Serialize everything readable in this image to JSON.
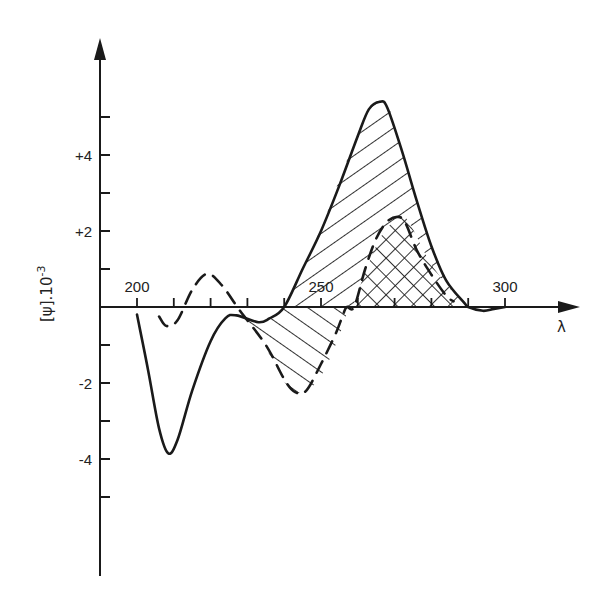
{
  "chart_data": {
    "type": "line",
    "title": "",
    "xlabel": "λ",
    "ylabel": "[ψ].10⁻³",
    "ylabel_parts": {
      "main": "[ψ].10",
      "sup": "-3"
    },
    "xlim": [
      190,
      320
    ],
    "ylim": [
      -7,
      6.5
    ],
    "grid": false,
    "legend": "none",
    "x_ticks": [
      200,
      210,
      220,
      230,
      240,
      250,
      260,
      270,
      280,
      290,
      300
    ],
    "x_tick_labels": [
      {
        "value": 200,
        "label": "200"
      },
      {
        "value": 250,
        "label": "250"
      },
      {
        "value": 300,
        "label": "300"
      }
    ],
    "y_ticks": [
      5,
      4,
      3,
      2,
      1,
      -1,
      -2,
      -3,
      -4,
      -5
    ],
    "y_tick_labels": [
      {
        "value": 4,
        "label": "+4"
      },
      {
        "value": 2,
        "label": "+2"
      },
      {
        "value": -2,
        "label": "-2"
      },
      {
        "value": -4,
        "label": "-4"
      }
    ],
    "series": [
      {
        "name": "solid",
        "style": "solid",
        "x": [
          200,
          203,
          206,
          208.5,
          211,
          215,
          220,
          224,
          227,
          233,
          236,
          240,
          245,
          250,
          255,
          260,
          263,
          266,
          268,
          272,
          276,
          280,
          284,
          289,
          290,
          294,
          297,
          300
        ],
        "values": [
          -0.2,
          -1.65,
          -3.2,
          -3.85,
          -3.5,
          -2.2,
          -0.9,
          -0.3,
          -0.22,
          -0.4,
          -0.3,
          0,
          1.0,
          2.0,
          3.2,
          4.5,
          5.2,
          5.4,
          5.25,
          4.1,
          2.8,
          1.6,
          0.7,
          0.1,
          0,
          -0.1,
          -0.05,
          0
        ]
      },
      {
        "name": "dashed",
        "style": "dashed",
        "x": [
          206,
          208,
          211,
          215,
          219,
          223,
          228,
          235,
          240,
          243,
          246,
          250,
          254,
          256,
          257,
          259,
          262,
          265,
          268,
          271,
          273,
          276,
          280,
          284,
          286
        ],
        "values": [
          -0.25,
          -0.5,
          -0.35,
          0.45,
          0.87,
          0.58,
          -0.1,
          -1.0,
          -1.9,
          -2.24,
          -2.2,
          -1.5,
          -0.7,
          -0.2,
          0,
          0,
          1.0,
          1.8,
          2.25,
          2.37,
          2.2,
          1.5,
          0.85,
          0.3,
          0.15
        ]
      }
    ],
    "shaded_regions": [
      {
        "type": "single-hatch",
        "description": "area between solid and dashed curves, positive lobe",
        "x_range": [
          240,
          290
        ]
      },
      {
        "type": "single-hatch",
        "description": "negative lobe between curves",
        "x_range": [
          228,
          257
        ]
      },
      {
        "type": "cross-hatch",
        "description": "overlap under dashed positive band",
        "x_range": [
          259,
          289
        ]
      }
    ]
  }
}
